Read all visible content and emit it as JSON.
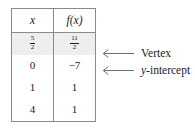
{
  "table": {
    "headers": [
      "x",
      "f(x)"
    ],
    "rows": [
      {
        "x": "5/2",
        "x_num": "5",
        "x_den": "2",
        "fx": "11/2",
        "fx_num": "11",
        "fx_den": "2",
        "highlighted": true
      },
      {
        "x": "0",
        "fx": "−7",
        "highlighted": false
      },
      {
        "x": "1",
        "fx": "1",
        "highlighted": false
      },
      {
        "x": "4",
        "fx": "1",
        "highlighted": false
      }
    ]
  },
  "annotations": [
    {
      "label": "Vertex",
      "icon": "left-arrow-icon",
      "target_row": 1
    },
    {
      "label_prefix": "y",
      "label_suffix": "-intercept",
      "label": "y-intercept",
      "icon": "left-arrow-icon",
      "target_row": 2
    }
  ],
  "colors": {
    "border": "#8a8a8a",
    "highlight_row": "#eeeeee",
    "text": "#1a1a1a",
    "arrow": "#6e6e6e",
    "background": "#ffffff"
  }
}
